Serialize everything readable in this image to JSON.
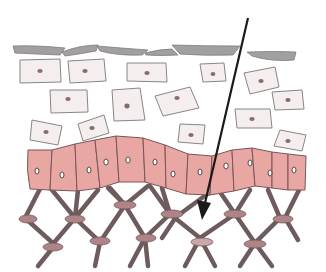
{
  "diagram": {
    "colors": {
      "background": "#ffffff",
      "surface_layer": "#9a9898",
      "outer_cells_fill": "#f4efee",
      "outer_cells_stroke": "#8a8585",
      "nucleus": "#8a6a6a",
      "basal_cells_fill": "#e9a7a3",
      "basal_cells_stroke": "#7a5556",
      "lattice_strut": "#6e5b5e",
      "lattice_node": "#b58a8d",
      "arrow": "#1a1a1a"
    },
    "layers": [
      {
        "name": "surface-flakes"
      },
      {
        "name": "squamous-cells",
        "count": 16
      },
      {
        "name": "basal-cells",
        "count": 13
      },
      {
        "name": "connective-lattice",
        "nodes": 14
      }
    ],
    "arrow": {
      "from": [
        248,
        18
      ],
      "to": [
        202,
        218
      ]
    }
  }
}
